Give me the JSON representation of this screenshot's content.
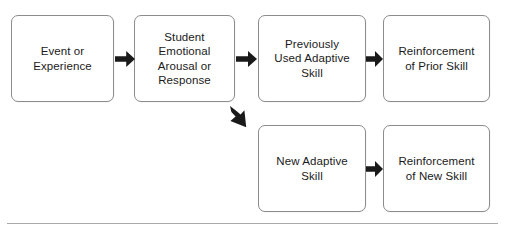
{
  "diagram": {
    "type": "flowchart",
    "background_color": "#ffffff",
    "node_border_color": "#8c8c8c",
    "node_text_color": "#1a1a1a",
    "arrow_color": "#1a1a1a",
    "rule_color": "#a9a9a9",
    "nodes": [
      {
        "id": "event-or-experience",
        "label": "Event or\nExperience",
        "row": "top",
        "order": 1
      },
      {
        "id": "student-emotional-arousal-or-response",
        "label": "Student\nEmotional\nArousal or\nResponse",
        "row": "top",
        "order": 2
      },
      {
        "id": "previously-used-adaptive-skill",
        "label": "Previously\nUsed Adaptive\nSkill",
        "row": "top",
        "order": 3
      },
      {
        "id": "reinforcement-of-prior-skill",
        "label": "Reinforcement\nof Prior Skill",
        "row": "top",
        "order": 4
      },
      {
        "id": "new-adaptive-skill",
        "label": "New Adaptive\nSkill",
        "row": "bottom",
        "order": 1
      },
      {
        "id": "reinforcement-of-new-skill",
        "label": "Reinforcement\nof New Skill",
        "row": "bottom",
        "order": 2
      }
    ],
    "connectors": [
      {
        "id": "arrow-event-to-student",
        "from": "event-or-experience",
        "to": "student-emotional-arousal-or-response",
        "direction": "right"
      },
      {
        "id": "arrow-student-to-previously-used",
        "from": "student-emotional-arousal-or-response",
        "to": "previously-used-adaptive-skill",
        "direction": "right"
      },
      {
        "id": "arrow-previously-used-to-reinforcement-prior",
        "from": "previously-used-adaptive-skill",
        "to": "reinforcement-of-prior-skill",
        "direction": "right"
      },
      {
        "id": "arrow-student-to-new-adaptive",
        "from": "student-emotional-arousal-or-response",
        "to": "new-adaptive-skill",
        "direction": "down-right"
      },
      {
        "id": "arrow-new-adaptive-to-reinforcement-new",
        "from": "new-adaptive-skill",
        "to": "reinforcement-of-new-skill",
        "direction": "right"
      }
    ]
  }
}
